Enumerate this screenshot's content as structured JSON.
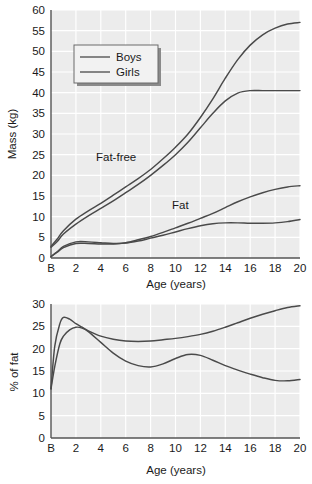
{
  "figure": {
    "background_color": "#ffffff",
    "plot_background_color": "#ececec",
    "gridline_color": "#ffffff",
    "axis_color": "#555555",
    "line_color": "#4a4a4a"
  },
  "chart_data": [
    {
      "type": "line",
      "panel": "top",
      "title": "",
      "xlabel": "Age (years)",
      "ylabel": "Mass (kg)",
      "xlim": [
        0,
        20
      ],
      "ylim": [
        0,
        60
      ],
      "xticks": [
        0,
        2,
        4,
        6,
        8,
        10,
        12,
        14,
        16,
        18,
        20
      ],
      "xticklabels": [
        "B",
        "2",
        "4",
        "6",
        "8",
        "10",
        "12",
        "14",
        "16",
        "18",
        "20"
      ],
      "yticks": [
        0,
        5,
        10,
        15,
        20,
        25,
        30,
        35,
        40,
        45,
        50,
        55,
        60
      ],
      "yticklabels": [
        "0",
        "5",
        "10",
        "15",
        "20",
        "25",
        "30",
        "35",
        "40",
        "45",
        "50",
        "55",
        "60"
      ],
      "grid": true,
      "legend": {
        "position": "upper-left-inside",
        "entries": [
          "Boys",
          "Girls"
        ]
      },
      "annotations": [
        {
          "text": "Fat-free",
          "x": 5.0,
          "y": 23.5
        },
        {
          "text": "Fat",
          "x": 11.0,
          "y": 13.0
        }
      ],
      "x": [
        0,
        0.5,
        1,
        2,
        3,
        4,
        5,
        6,
        7,
        8,
        9,
        10,
        11,
        12,
        13,
        14,
        15,
        16,
        17,
        18,
        19,
        20
      ],
      "series": [
        {
          "name": "Fat-free mass, Boys",
          "group": "Fat-free",
          "sex": "Boys",
          "values": [
            2.8,
            4.6,
            6.6,
            9.4,
            11.4,
            13.2,
            15.2,
            17.2,
            19.2,
            21.4,
            24.0,
            26.8,
            30.0,
            34.0,
            38.5,
            43.5,
            48.0,
            51.5,
            54.0,
            55.6,
            56.6,
            57.0
          ]
        },
        {
          "name": "Fat-free mass, Girls",
          "group": "Fat-free",
          "sex": "Girls",
          "values": [
            2.6,
            4.0,
            5.8,
            8.2,
            10.2,
            12.0,
            13.8,
            15.8,
            17.8,
            20.0,
            22.4,
            25.0,
            28.0,
            31.5,
            35.0,
            38.0,
            39.9,
            40.5,
            40.5,
            40.5,
            40.5,
            40.5
          ]
        },
        {
          "name": "Fat mass, Girls",
          "group": "Fat",
          "sex": "Girls",
          "values": [
            0.35,
            1.4,
            2.5,
            3.5,
            3.5,
            3.4,
            3.4,
            3.7,
            4.4,
            5.2,
            6.2,
            7.3,
            8.4,
            9.6,
            10.8,
            12.2,
            13.6,
            14.8,
            15.8,
            16.6,
            17.2,
            17.5
          ]
        },
        {
          "name": "Fat mass, Boys",
          "group": "Fat",
          "sex": "Boys",
          "values": [
            0.35,
            1.5,
            2.8,
            3.9,
            3.9,
            3.7,
            3.5,
            3.6,
            4.1,
            4.8,
            5.5,
            6.3,
            7.1,
            7.8,
            8.3,
            8.5,
            8.5,
            8.4,
            8.4,
            8.5,
            8.8,
            9.3
          ]
        }
      ]
    },
    {
      "type": "line",
      "panel": "bottom",
      "title": "",
      "xlabel": "Age (years)",
      "ylabel": "% of fat",
      "xlim": [
        0,
        20
      ],
      "ylim": [
        0,
        30
      ],
      "xticks": [
        0,
        2,
        4,
        6,
        8,
        10,
        12,
        14,
        16,
        18,
        20
      ],
      "xticklabels": [
        "B",
        "2",
        "4",
        "6",
        "8",
        "10",
        "12",
        "14",
        "16",
        "18",
        "20"
      ],
      "yticks": [
        0,
        5,
        10,
        15,
        20,
        25,
        30
      ],
      "yticklabels": [
        "0",
        "5",
        "10",
        "15",
        "20",
        "25",
        "30"
      ],
      "grid": true,
      "legend": null,
      "annotations": [],
      "x": [
        0,
        0.3,
        0.7,
        1,
        1.5,
        2,
        2.5,
        3,
        4,
        5,
        6,
        7,
        8,
        9,
        10,
        11,
        12,
        13,
        14,
        15,
        16,
        17,
        18,
        19,
        20
      ],
      "series": [
        {
          "name": "% fat, Girls",
          "sex": "Girls",
          "values": [
            11.0,
            20.5,
            25.5,
            27.0,
            26.6,
            25.6,
            24.8,
            24.0,
            22.8,
            22.1,
            21.7,
            21.6,
            21.7,
            22.0,
            22.3,
            22.7,
            23.2,
            23.9,
            24.8,
            25.8,
            26.8,
            27.7,
            28.5,
            29.2,
            29.6
          ]
        },
        {
          "name": "% fat, Boys",
          "sex": "Boys",
          "values": [
            11.0,
            16.0,
            21.0,
            22.8,
            24.2,
            24.8,
            24.6,
            23.8,
            21.4,
            19.0,
            17.2,
            16.2,
            15.9,
            16.6,
            17.8,
            18.7,
            18.5,
            17.4,
            16.2,
            15.2,
            14.3,
            13.5,
            12.9,
            12.8,
            13.1
          ]
        }
      ]
    }
  ]
}
